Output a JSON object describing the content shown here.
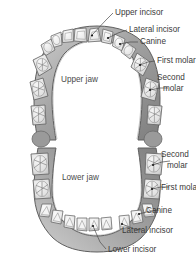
{
  "figure": {
    "title_visible": false,
    "background_color": "#ffffff",
    "line_color": "#4a4a4a",
    "text_color": "#3a3a3a",
    "gum_fill_color": "#9a9a9a",
    "tooth_fill_color": "#e8e8e8"
  },
  "upper": {
    "jaw_label": "Upper jaw",
    "labels": [
      {
        "id": "upper-incisor",
        "text": "Upper incisor"
      },
      {
        "id": "lateral-incisor",
        "text": "Lateral incisor"
      },
      {
        "id": "canine",
        "text": "Canine"
      },
      {
        "id": "first-molar",
        "text": "First molar"
      },
      {
        "id": "second-molar-1",
        "text": "Second"
      },
      {
        "id": "second-molar-2",
        "text": "molar"
      }
    ]
  },
  "lower": {
    "jaw_label": "Lower jaw",
    "labels": [
      {
        "id": "second-molar-1",
        "text": "Second"
      },
      {
        "id": "second-molar-2",
        "text": "molar"
      },
      {
        "id": "first-molar",
        "text": "First molar"
      },
      {
        "id": "canine",
        "text": "Canine"
      },
      {
        "id": "lateral-incisor",
        "text": "Lateral incisor"
      },
      {
        "id": "lower-incisor",
        "text": "Lower incisor"
      }
    ]
  }
}
